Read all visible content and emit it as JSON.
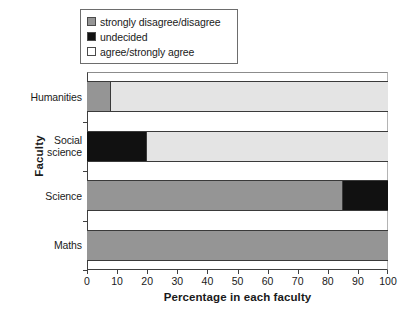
{
  "chart_data": {
    "type": "bar",
    "orientation": "horizontal",
    "stacked": true,
    "title": "",
    "xlabel": "Percentage in each faculty",
    "ylabel": "Faculty",
    "categories": [
      "Humanities",
      "Social science",
      "Science",
      "Maths"
    ],
    "category_lines": [
      [
        "Humanities"
      ],
      [
        "Social",
        "science"
      ],
      [
        "Science"
      ],
      [
        "Maths"
      ]
    ],
    "series": [
      {
        "name": "strongly disagree/disagree",
        "color": "#959595",
        "values": [
          8,
          0,
          85,
          100
        ]
      },
      {
        "name": "undecided",
        "color": "#111111",
        "values": [
          0,
          20,
          15,
          0
        ]
      },
      {
        "name": "agree/strongly agree",
        "color": "#e4e4e4",
        "values": [
          92,
          80,
          0,
          0
        ]
      }
    ],
    "xlim": [
      0,
      100
    ],
    "xticks": [
      0,
      10,
      20,
      30,
      40,
      50,
      60,
      70,
      80,
      90,
      100
    ],
    "xtick_labels": [
      "0",
      "10",
      "20",
      "30",
      "40",
      "50",
      "60",
      "70",
      "80",
      "90",
      "100"
    ],
    "grid": false,
    "legend_position": "top"
  },
  "legend": {
    "items": [
      {
        "label": "strongly disagree/disagree",
        "swatch_name": "swatch-strongly-disagree",
        "color": "#959595"
      },
      {
        "label": "undecided",
        "swatch_name": "swatch-undecided",
        "color": "#111111"
      },
      {
        "label": "agree/strongly agree",
        "swatch_name": "swatch-agree",
        "color": "#ffffff"
      }
    ]
  },
  "axes": {
    "y_title": "Faculty",
    "x_title": "Percentage in each faculty"
  }
}
